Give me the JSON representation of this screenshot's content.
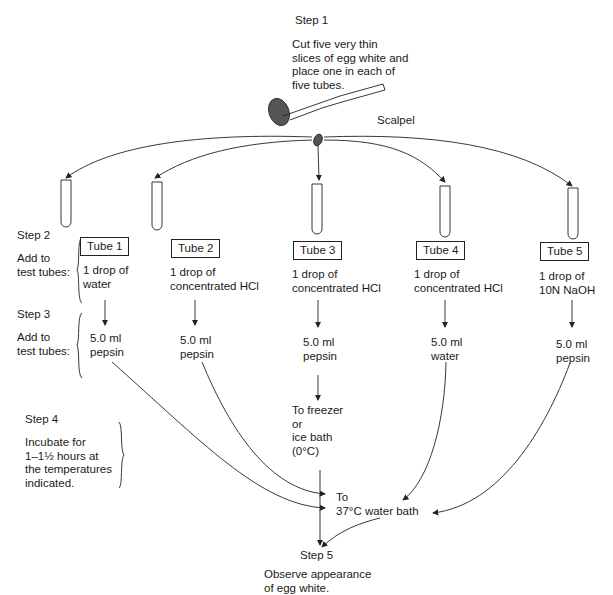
{
  "step1": {
    "label": "Step 1",
    "text": "Cut five very thin\nslices of egg white and\nplace one in each of\nfive tubes.",
    "scalpel_label": "Scalpel"
  },
  "step2": {
    "label": "Step 2",
    "text": "Add to\ntest tubes:"
  },
  "step3": {
    "label": "Step 3",
    "text": "Add to\ntest tubes:"
  },
  "step4": {
    "label": "Step 4",
    "text": "Incubate for\n1–1½ hours at\nthe temperatures\nindicated."
  },
  "step5": {
    "label": "Step 5",
    "text": "Observe appearance\nof egg white."
  },
  "tubes": [
    {
      "name": "Tube 1",
      "step2": "1 drop of\nwater",
      "step3": "5.0 ml\npepsin"
    },
    {
      "name": "Tube 2",
      "step2": "1 drop of\nconcentrated HCl",
      "step3": "5.0 ml\npepsin"
    },
    {
      "name": "Tube 3",
      "step2": "1 drop of\nconcentrated HCl",
      "step3": "5.0 ml\npepsin"
    },
    {
      "name": "Tube 4",
      "step2": "1 drop of\nconcentrated HCl",
      "step3": "5.0 ml\nwater"
    },
    {
      "name": "Tube 5",
      "step2": "1 drop of\n10N NaOH",
      "step3": "5.0 ml\npepsin"
    }
  ],
  "destinations": {
    "freezer": "To freezer\nor\nice bath\n(0°C)",
    "water_bath": "To\n37°C water bath"
  }
}
